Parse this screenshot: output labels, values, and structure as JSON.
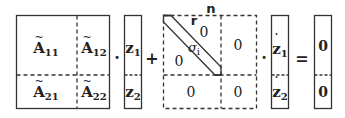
{
  "diagram": {
    "matrix_A": {
      "blocks": [
        {
          "base": "A",
          "sub": "11"
        },
        {
          "base": "A",
          "sub": "12"
        },
        {
          "base": "A",
          "sub": "21"
        },
        {
          "base": "A",
          "sub": "22"
        }
      ]
    },
    "vector_z": {
      "entries": [
        {
          "base": "z",
          "sub": "1"
        },
        {
          "base": "z",
          "sub": "2"
        }
      ]
    },
    "matrix_sigma": {
      "dim_label_n": "n",
      "dim_label_r": "r",
      "diag_label": {
        "base": "σ",
        "sub": "i"
      },
      "upper_zero": "0",
      "lower_zero": "0",
      "block_12": "0",
      "block_21": "0",
      "block_22": "0"
    },
    "vector_zdot": {
      "entries": [
        {
          "base": "z",
          "sub": "1"
        },
        {
          "base": "z",
          "sub": "2"
        }
      ]
    },
    "result": {
      "entries": [
        "0",
        "0"
      ]
    },
    "operators": {
      "dot1": "·",
      "plus": "+",
      "dot2": "·",
      "equals": "="
    },
    "colors": {
      "line": "#333333",
      "text": "#222222"
    }
  }
}
